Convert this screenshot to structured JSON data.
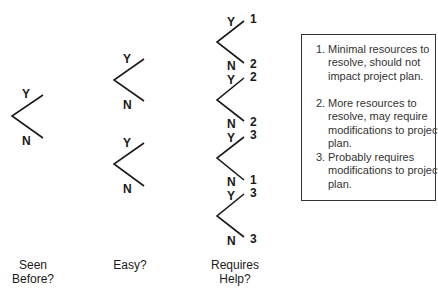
{
  "diagram": {
    "columns": [
      {
        "label_line1": "Seen",
        "label_line2": "Before?"
      },
      {
        "label_line1": "Easy?",
        "label_line2": ""
      },
      {
        "label_line1": "Requires",
        "label_line2": "Help?"
      }
    ],
    "branch_labels": {
      "yes": "Y",
      "no": "N"
    },
    "outcomes": [
      "1",
      "2",
      "2",
      "2",
      "3",
      "1",
      "3",
      "3"
    ],
    "legend": [
      {
        "num": "1.",
        "text": "Minimal resources to resolve, should not impact project plan."
      },
      {
        "num": "2.",
        "text": "More resources to resolve, may require modifications to project plan."
      },
      {
        "num": "3.",
        "text": "Probably requires modifications to project plan."
      }
    ],
    "colors": {
      "line": "#1a1a1a",
      "border": "#333333",
      "background": "#ffffff"
    }
  }
}
